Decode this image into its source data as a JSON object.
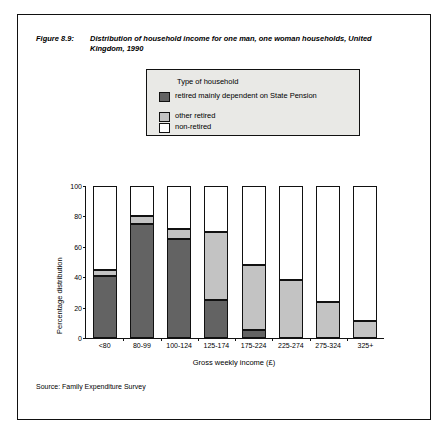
{
  "figure": {
    "label": "Figure 8.9:",
    "title": "Distribution of household income for one man, one woman households, United Kingdom, 1990",
    "source": "Source: Family Expenditure Survey"
  },
  "legend": {
    "title": "Type of household",
    "items": [
      {
        "label": "retired mainly dependent on State Pension",
        "color": "#636363"
      },
      {
        "label": "other retired",
        "color": "#c3c3c3"
      },
      {
        "label": "non-retired",
        "color": "#ffffff"
      }
    ]
  },
  "chart_data": {
    "type": "bar",
    "stacked": true,
    "title": "Distribution of household income for one man, one woman households, United Kingdom, 1990",
    "xlabel": "Gross weekly income (£)",
    "ylabel": "Percentage distribution",
    "ylim": [
      0,
      100
    ],
    "yticks": [
      0,
      20,
      40,
      60,
      80,
      100
    ],
    "grid": false,
    "legend_position": "top",
    "categories": [
      "<80",
      "80-99",
      "100-124",
      "125-174",
      "175-224",
      "225-274",
      "275-324",
      "325+"
    ],
    "series": [
      {
        "name": "retired mainly dependent on State Pension",
        "color": "#636363",
        "values": [
          41,
          75,
          65,
          25,
          5,
          0,
          0,
          0
        ]
      },
      {
        "name": "other retired",
        "color": "#c3c3c3",
        "values": [
          4,
          5,
          7,
          45,
          43,
          38,
          24,
          11
        ]
      },
      {
        "name": "non-retired",
        "color": "#ffffff",
        "values": [
          55,
          20,
          28,
          30,
          52,
          62,
          76,
          89
        ]
      }
    ]
  }
}
